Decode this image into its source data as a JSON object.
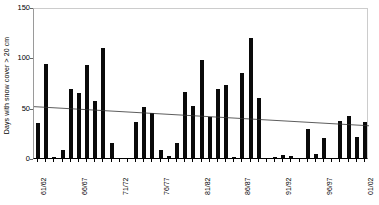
{
  "chart_data": {
    "type": "bar",
    "title": "",
    "xlabel": "",
    "ylabel": "Days with snow cover > 20 cm",
    "ylim": [
      0,
      150
    ],
    "yticks": [
      0,
      50,
      100,
      150
    ],
    "grid": false,
    "legend": "none",
    "bar_color": "#0a0a0a",
    "trend_color": "#333333",
    "categories": [
      "61/62",
      "62/63",
      "63/64",
      "64/65",
      "65/66",
      "66/67",
      "67/68",
      "68/69",
      "69/70",
      "70/71",
      "71/72",
      "72/73",
      "73/74",
      "74/75",
      "75/76",
      "76/77",
      "77/78",
      "78/79",
      "79/80",
      "80/81",
      "81/82",
      "82/83",
      "83/84",
      "84/85",
      "85/86",
      "86/87",
      "87/88",
      "88/89",
      "89/90",
      "90/91",
      "91/92",
      "92/93",
      "93/94",
      "94/95",
      "95/96",
      "96/97",
      "97/98",
      "98/99",
      "99/00",
      "00/01",
      "01/02"
    ],
    "labeled_categories": [
      "61/62",
      "66/67",
      "71/72",
      "76/77",
      "81/82",
      "86/87",
      "91/92",
      "96/97",
      "01/02"
    ],
    "values": [
      35,
      93,
      1,
      8,
      69,
      65,
      92,
      57,
      109,
      15,
      0,
      0,
      36,
      51,
      45,
      8,
      2,
      15,
      66,
      52,
      97,
      41,
      69,
      73,
      1,
      84,
      119,
      60,
      0,
      1,
      3,
      2,
      0,
      29,
      4,
      20,
      0,
      37,
      42,
      21,
      36
    ],
    "trendline": {
      "type": "linear",
      "start_value": 53,
      "end_value": 34
    }
  },
  "axes": {
    "y_tick_labels": [
      "150",
      "100",
      "50",
      "0"
    ],
    "y_title": "Days with snow cover > 20 cm"
  }
}
